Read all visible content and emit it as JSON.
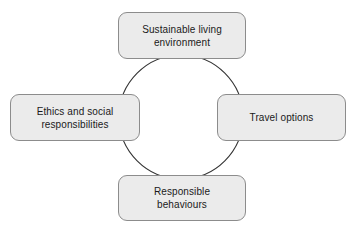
{
  "diagram": {
    "type": "cycle-diagram",
    "background_color": "#ffffff",
    "circle": {
      "name": "connecting-circle",
      "center_x": 181,
      "center_y": 117,
      "radius": 62,
      "stroke_color": "#333333",
      "stroke_width": 1
    },
    "box_style": {
      "fill_color": "#ebebeb",
      "border_color": "#8c8c8c",
      "text_color": "#1a1a1a"
    },
    "nodes": [
      {
        "id": "top",
        "position": "top",
        "label": "Sustainable living\nenvironment"
      },
      {
        "id": "right",
        "position": "right",
        "label": "Travel options"
      },
      {
        "id": "bottom",
        "position": "bottom",
        "label": "Responsible\nbehaviours"
      },
      {
        "id": "left",
        "position": "left",
        "label": "Ethics and social\nresponsibilities"
      }
    ]
  }
}
